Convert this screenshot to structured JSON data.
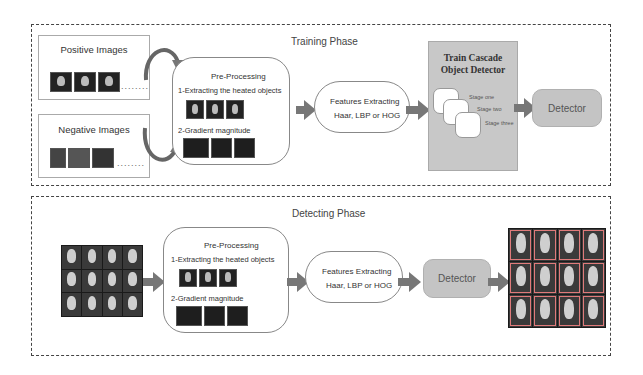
{
  "training": {
    "title": "Training Phase",
    "positive_label": "Positive Images",
    "negative_label": "Negative Images",
    "dots": "........",
    "preprocessing": {
      "title": "Pre-Processing",
      "step1": "1-Extracting the heated objects",
      "step2": "2-Gradient magnitude"
    },
    "features": {
      "line1": "Features Extracting",
      "line2": "Haar, LBP or HOG"
    },
    "cascade": {
      "title_line1": "Train Cascade",
      "title_line2": "Object Detector",
      "stages": [
        "Stage one",
        "Stage two",
        "Stage three"
      ]
    },
    "detector_label": "Detector"
  },
  "detecting": {
    "title": "Detecting Phase",
    "preprocessing": {
      "title": "Pre-Processing",
      "step1": "1-Extracting the heated objects",
      "step2": "2-Gradient magnitude"
    },
    "features": {
      "line1": "Features Extracting",
      "line2": "Haar, LBP or HOG"
    },
    "detector_label": "Detector"
  },
  "colors": {
    "arrow": "#777777",
    "cascade_bg": "#c8c8c8",
    "detector_bg": "#c4c4c4",
    "detection_box": "#e07a7a"
  }
}
